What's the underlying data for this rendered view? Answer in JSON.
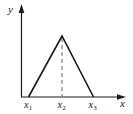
{
  "figure": {
    "kind": "triangular-pulse-plot",
    "axis_labels": {
      "y": "y",
      "x": "x"
    },
    "ticks": [
      {
        "base": "x",
        "sub": "1"
      },
      {
        "base": "x",
        "sub": "2"
      },
      {
        "base": "x",
        "sub": "3"
      }
    ],
    "geometry_note": "triangle base from x1 to x3 on x-axis, apex above x2, dashed drop line from apex to x2",
    "colors": {
      "line": "#1a1a1a",
      "dashed": "#666666",
      "background": "#ffffff"
    }
  }
}
